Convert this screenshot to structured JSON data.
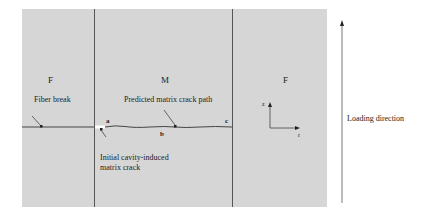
{
  "diagram": {
    "regions": {
      "left": "F",
      "middle": "M",
      "right": "F"
    },
    "labels": {
      "fiber_break": "Fiber break",
      "predicted_path": "Predicted  matrix crack path",
      "initial_crack_line1": "Initial cavity-induced",
      "initial_crack_line2": "matrix crack",
      "point_a": "a",
      "point_b": "b",
      "point_c": "c",
      "axis_z": "z",
      "axis_r": "r",
      "loading": "Loading direction"
    },
    "colors": {
      "panel": "#d6d6d6",
      "line": "#555555",
      "background": "#ffffff"
    }
  }
}
